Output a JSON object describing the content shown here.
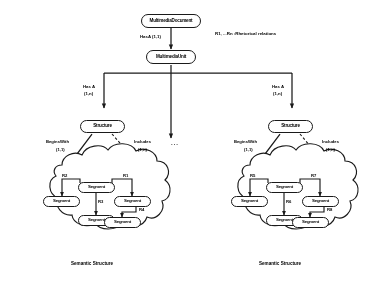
{
  "diagram": {
    "title_note": "R1, ...Rn :Rhetorical relations",
    "ellipsis": "...",
    "entities": {
      "multimedia_document": "MultimediaDocument",
      "multimedia_unit": "MultimediaUnit",
      "structure_left": "Structure",
      "structure_right": "Structure"
    },
    "cardinalities": {
      "hasa_top": "HasA (1,1)",
      "hasa_left": "Has A\n(1,n)",
      "hasa_left_name": "Has A",
      "hasa_left_card": "(1,n)",
      "hasa_right_name": "Has A",
      "hasa_right_card": "(1,n)",
      "beginswith_name": "BeginsWith",
      "beginswith_card": "(1,1)",
      "includes_left_name": "Includes",
      "includes_left_card": "(1,n)",
      "beginswith_right_name": "BeginsWith",
      "beginswith_right_card": "(1,1)",
      "includes_right_name": "Includes",
      "includes_right_card": "(1,n)"
    },
    "left_cloud": {
      "caption": "Semantic Structure",
      "segments": [
        {
          "id": "root",
          "label": "Segment"
        },
        {
          "id": "left",
          "label": "Segment"
        },
        {
          "id": "mid",
          "label": "Segment"
        },
        {
          "id": "right",
          "label": "Segment"
        },
        {
          "id": "far",
          "label": "Segment"
        }
      ],
      "relations": [
        {
          "id": "r2",
          "label": "R2"
        },
        {
          "id": "r1",
          "label": "R1"
        },
        {
          "id": "r3",
          "label": "R3"
        },
        {
          "id": "r4",
          "label": "R4"
        }
      ]
    },
    "right_cloud": {
      "caption": "Semantic Structure",
      "segments": [
        {
          "id": "root",
          "label": "Segment"
        },
        {
          "id": "left",
          "label": "Segment"
        },
        {
          "id": "mid",
          "label": "Segment"
        },
        {
          "id": "right",
          "label": "Segment"
        },
        {
          "id": "far",
          "label": "Segment"
        }
      ],
      "relations": [
        {
          "id": "r5",
          "label": "R5"
        },
        {
          "id": "r7",
          "label": "R7"
        },
        {
          "id": "r6",
          "label": "R6"
        },
        {
          "id": "r8",
          "label": "R8"
        }
      ]
    },
    "colors": {
      "stroke": "#1a1a1a",
      "background": "#ffffff",
      "text": "#000000"
    }
  }
}
